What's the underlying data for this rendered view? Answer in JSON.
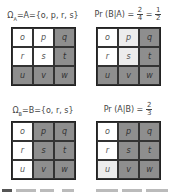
{
  "panels": [
    {
      "id": "top-left",
      "title": "Ω_A = A = {o, p, r, s}",
      "title_text": "Ω",
      "title_sub": "A",
      "title_rest": "=A={o,  p,  r,  s}",
      "cells": [
        {
          "label": "o",
          "shade": "white"
        },
        {
          "label": "p",
          "shade": "white"
        },
        {
          "label": "q",
          "shade": "dark"
        },
        {
          "label": "r",
          "shade": "white"
        },
        {
          "label": "s",
          "shade": "white"
        },
        {
          "label": "t",
          "shade": "dark"
        },
        {
          "label": "u",
          "shade": "dark"
        },
        {
          "label": "v",
          "shade": "dark"
        },
        {
          "label": "w",
          "shade": "dark"
        }
      ]
    },
    {
      "id": "top-right",
      "title_prefix": "Pr (B|A) =",
      "frac1_num": "2",
      "frac1_den": "4",
      "equals": "=",
      "frac2_num": "1",
      "frac2_den": "2",
      "cells": [
        {
          "label": "o",
          "shade": "white"
        },
        {
          "label": "p",
          "shade": "light"
        },
        {
          "label": "q",
          "shade": "dark"
        },
        {
          "label": "r",
          "shade": "white"
        },
        {
          "label": "s",
          "shade": "light"
        },
        {
          "label": "t",
          "shade": "dark"
        },
        {
          "label": "u",
          "shade": "dark"
        },
        {
          "label": "v",
          "shade": "dark"
        },
        {
          "label": "w",
          "shade": "dark"
        }
      ]
    },
    {
      "id": "bottom-left",
      "title_text": "Ω",
      "title_sub": "B",
      "title_rest": "=B={o,  r,  s}",
      "cells": [
        {
          "label": "o",
          "shade": "white"
        },
        {
          "label": "p",
          "shade": "dark"
        },
        {
          "label": "q",
          "shade": "dark"
        },
        {
          "label": "r",
          "shade": "white"
        },
        {
          "label": "s",
          "shade": "dark"
        },
        {
          "label": "t",
          "shade": "dark"
        },
        {
          "label": "u",
          "shade": "white"
        },
        {
          "label": "v",
          "shade": "dark"
        },
        {
          "label": "w",
          "shade": "dark"
        }
      ]
    },
    {
      "id": "bottom-right",
      "title_prefix": "Pr (A|B) =",
      "frac1_num": "2",
      "frac1_den": "3",
      "cells": [
        {
          "label": "o",
          "shade": "white"
        },
        {
          "label": "p",
          "shade": "dark"
        },
        {
          "label": "q",
          "shade": "dark"
        },
        {
          "label": "r",
          "shade": "white"
        },
        {
          "label": "s",
          "shade": "dark"
        },
        {
          "label": "t",
          "shade": "dark"
        },
        {
          "label": "u",
          "shade": "light"
        },
        {
          "label": "v",
          "shade": "dark"
        },
        {
          "label": "w",
          "shade": "dark"
        }
      ]
    }
  ],
  "colors": {
    "white": "#ffffff",
    "light": "#ececec",
    "dark": "#8e8e8e",
    "border": "#222222"
  }
}
